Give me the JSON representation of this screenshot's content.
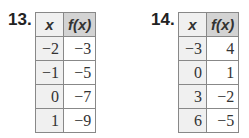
{
  "problems": [
    {
      "number": "13.",
      "headers": [
        "x",
        "f(x)"
      ],
      "rows": [
        [
          "−2",
          "−3"
        ],
        [
          "−1",
          "−5"
        ],
        [
          "0",
          "−7"
        ],
        [
          "1",
          "−9"
        ]
      ]
    },
    {
      "number": "14.",
      "headers": [
        "x",
        "f(x)"
      ],
      "rows": [
        [
          "−3",
          "4"
        ],
        [
          "0",
          "1"
        ],
        [
          "3",
          "−2"
        ],
        [
          "6",
          "−5"
        ]
      ]
    }
  ]
}
